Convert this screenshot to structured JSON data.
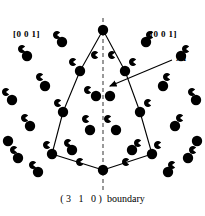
{
  "figure": {
    "background_color": "#ffffff",
    "ink_color": "#000000",
    "axis_color": "#808080",
    "width": 205,
    "height": 216
  },
  "labels": {
    "direction_left": "[0 0 1]",
    "direction_right": "[0 0 1]",
    "annotation_al": "Al",
    "caption_indices": "(3  1  0)",
    "caption_word": "boundary"
  },
  "symmetry_axis": {
    "name": "mirror-plane",
    "x": 103,
    "y_top": 18,
    "y_bottom": 192,
    "style": "dashed",
    "color": "#808080"
  },
  "annotation_arrow": {
    "from_x": 172,
    "from_y": 60,
    "to_x": 110,
    "to_y": 86
  },
  "boundary_polygon": {
    "name": "structural-unit-outline",
    "points": [
      [
        103,
        30
      ],
      [
        80,
        71
      ],
      [
        63,
        112
      ],
      [
        52,
        154
      ],
      [
        103,
        170
      ],
      [
        152,
        154
      ],
      [
        140,
        112
      ],
      [
        125,
        71
      ]
    ]
  },
  "chart_data": {
    "type": "scatter",
    "xlabel": "",
    "ylabel": "",
    "xlim": [
      0,
      205
    ],
    "ylim": [
      0,
      216
    ],
    "grid": false,
    "legend": false,
    "series": [
      {
        "name": "atom-large",
        "marker": "filled-circle",
        "radius": 5.2,
        "color": "#000000",
        "points": [
          [
            103,
            30
          ],
          [
            62,
            42
          ],
          [
            146,
            42
          ],
          [
            27,
            56
          ],
          [
            181,
            56
          ],
          [
            80,
            71
          ],
          [
            125,
            71
          ],
          [
            45,
            86
          ],
          [
            163,
            86
          ],
          [
            12,
            100
          ],
          [
            196,
            100
          ],
          [
            63,
            112
          ],
          [
            140,
            112
          ],
          [
            30,
            126
          ],
          [
            175,
            126
          ],
          [
            90,
            130
          ],
          [
            116,
            130
          ],
          [
            8,
            141
          ],
          [
            197,
            141
          ],
          [
            52,
            154
          ],
          [
            152,
            154
          ],
          [
            72,
            150
          ],
          [
            132,
            150
          ],
          [
            18,
            158
          ],
          [
            188,
            158
          ],
          [
            103,
            170
          ],
          [
            38,
            172
          ],
          [
            168,
            172
          ],
          [
            96,
            96
          ],
          [
            110,
            96
          ]
        ]
      },
      {
        "name": "atom-small-crescent",
        "marker": "pacman-open-right",
        "radius": 4.0,
        "color": "#000000",
        "points": [
          [
            57,
            35
          ],
          [
            150,
            35
          ],
          [
            95,
            55
          ],
          [
            112,
            55
          ],
          [
            22,
            49
          ],
          [
            186,
            49
          ],
          [
            73,
            62
          ],
          [
            133,
            62
          ],
          [
            40,
            77
          ],
          [
            167,
            77
          ],
          [
            88,
            90
          ],
          [
            6,
            92
          ],
          [
            192,
            92
          ],
          [
            58,
            103
          ],
          [
            148,
            103
          ],
          [
            25,
            118
          ],
          [
            180,
            118
          ],
          [
            86,
            119
          ],
          [
            108,
            119
          ],
          [
            47,
            145
          ],
          [
            158,
            145
          ],
          [
            14,
            150
          ],
          [
            193,
            150
          ],
          [
            80,
            162
          ],
          [
            126,
            162
          ],
          [
            33,
            165
          ],
          [
            172,
            165
          ],
          [
            68,
            143
          ],
          [
            138,
            143
          ]
        ]
      }
    ]
  }
}
